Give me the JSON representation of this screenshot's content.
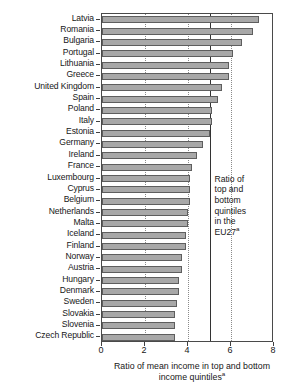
{
  "chart_data": {
    "type": "bar",
    "orientation": "horizontal",
    "title": "",
    "xlabel": "Ratio of mean income in top and bottom income quintiles",
    "xlabel_superscript": "a",
    "ylabel": "",
    "xlim": [
      0,
      8
    ],
    "xticks": [
      0,
      2,
      4,
      6,
      8
    ],
    "xtick_labels": [
      "0",
      "2",
      "4",
      "6",
      "8"
    ],
    "gridlines_dotted_at": [
      2,
      4,
      6
    ],
    "grid": true,
    "legend": "none",
    "categories": [
      "Latvia",
      "Romania",
      "Bulgaria",
      "Portugal",
      "Lithuania",
      "Greece",
      "United Kingdom",
      "Spain",
      "Poland",
      "Italy",
      "Estonia",
      "Germany",
      "Ireland",
      "France",
      "Luxembourg",
      "Cyprus",
      "Belgium",
      "Netherlands",
      "Malta",
      "Iceland",
      "Finland",
      "Norway",
      "Austria",
      "Hungary",
      "Denmark",
      "Sweden",
      "Slovakia",
      "Slovenia",
      "Czech Republic"
    ],
    "values": [
      7.3,
      7.0,
      6.5,
      6.1,
      5.9,
      5.9,
      5.6,
      5.4,
      5.1,
      5.1,
      5.0,
      4.7,
      4.4,
      4.2,
      4.1,
      4.1,
      4.1,
      4.0,
      4.0,
      3.9,
      3.9,
      3.7,
      3.7,
      3.6,
      3.6,
      3.5,
      3.4,
      3.4,
      3.4
    ],
    "reference_line": {
      "value": 5.0,
      "style": "solid",
      "label": "Ratio of top and bottom quintiles in the EU27",
      "label_superscript": "a"
    }
  },
  "annotation": {
    "line1": "Ratio of",
    "line2": "top and",
    "line3": "bottom",
    "line4": "quintiles",
    "line5": "in the",
    "line6": "EU27",
    "superscript": "a"
  },
  "axis": {
    "x_title_line1": "Ratio of mean income in top and bottom",
    "x_title_line2": "income quintiles",
    "x_title_superscript": "a"
  },
  "colors": {
    "bar_fill": "#a8a8a8",
    "bar_stroke": "#5e5e5e",
    "axis": "#4a4a4a",
    "gridline": "#8a8a8a",
    "reference_line": "#333333",
    "text": "#171717",
    "background": "#ffffff"
  }
}
